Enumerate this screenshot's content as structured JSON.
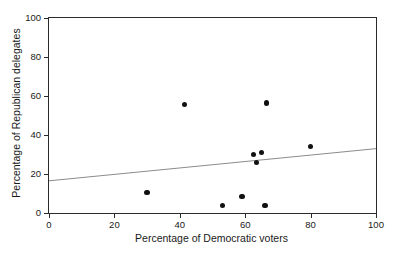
{
  "chart_data": {
    "type": "scatter",
    "title": "",
    "xlabel": "Percentage of Democratic voters",
    "ylabel": "Percentage of Republican delegates",
    "xlim": [
      0,
      100
    ],
    "ylim": [
      0,
      100
    ],
    "xticks": [
      0,
      20,
      40,
      60,
      80,
      100
    ],
    "yticks": [
      0,
      20,
      40,
      60,
      80,
      100
    ],
    "xtick_labels": [
      "0",
      "20",
      "40",
      "60",
      "80",
      "100"
    ],
    "ytick_labels": [
      "0",
      "20",
      "40",
      "60",
      "80",
      "100"
    ],
    "grid": false,
    "legend": false,
    "marker": "filled-circle",
    "marker_color": "#111111",
    "points": [
      {
        "x": 30.0,
        "y": 10.5
      },
      {
        "x": 41.5,
        "y": 55.5
      },
      {
        "x": 53.0,
        "y": 4.0
      },
      {
        "x": 59.0,
        "y": 8.5
      },
      {
        "x": 62.5,
        "y": 30.0
      },
      {
        "x": 63.5,
        "y": 26.0
      },
      {
        "x": 65.0,
        "y": 31.0
      },
      {
        "x": 66.0,
        "y": 4.0
      },
      {
        "x": 66.5,
        "y": 56.5
      },
      {
        "x": 80.0,
        "y": 34.0
      }
    ],
    "trendline": {
      "type": "line",
      "color": "#2b2b2b",
      "x": [
        0,
        100
      ],
      "y": [
        16.5,
        33.0
      ]
    }
  }
}
